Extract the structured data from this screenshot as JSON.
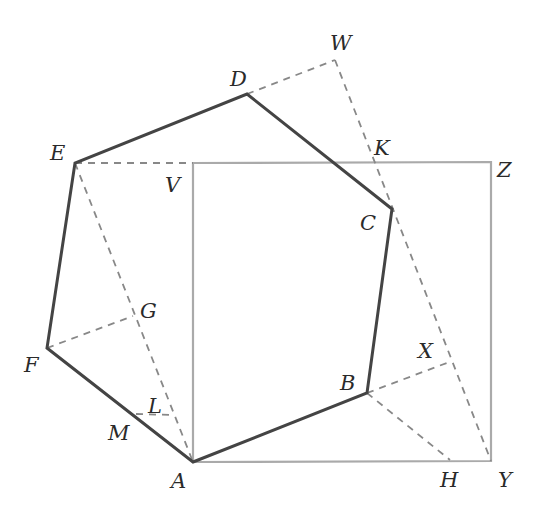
{
  "diagram": {
    "colors": {
      "hexagon": "#444444",
      "square": "#aaaaaa",
      "dashed": "#888888",
      "label": "#2a2a2a"
    },
    "points": {
      "A": {
        "x": 193,
        "y": 462,
        "label": "A",
        "lx": 171,
        "ly": 488
      },
      "B": {
        "x": 367,
        "y": 393,
        "label": "B",
        "lx": 340,
        "ly": 390
      },
      "C": {
        "x": 392,
        "y": 209,
        "label": "C",
        "lx": 360,
        "ly": 230
      },
      "D": {
        "x": 247,
        "y": 94,
        "label": "D",
        "lx": 230,
        "ly": 86
      },
      "E": {
        "x": 75,
        "y": 163,
        "label": "E",
        "lx": 50,
        "ly": 160
      },
      "F": {
        "x": 47,
        "y": 348,
        "label": "F",
        "lx": 24,
        "ly": 372
      },
      "G": {
        "x": 133,
        "y": 316,
        "label": "G",
        "lx": 140,
        "ly": 318
      },
      "H": {
        "x": 450,
        "y": 460,
        "label": "H",
        "lx": 440,
        "ly": 487
      },
      "K": {
        "x": 373,
        "y": 162,
        "label": "K",
        "lx": 374,
        "ly": 155
      },
      "L": {
        "x": 172,
        "y": 415,
        "label": "L",
        "lx": 148,
        "ly": 413
      },
      "M": {
        "x": 136,
        "y": 414,
        "label": "M",
        "lx": 108,
        "ly": 440
      },
      "V": {
        "x": 193,
        "y": 163,
        "label": "V",
        "lx": 165,
        "ly": 192
      },
      "W": {
        "x": 335,
        "y": 60,
        "label": "W",
        "lx": 330,
        "ly": 50
      },
      "X": {
        "x": 452,
        "y": 361,
        "label": "X",
        "lx": 418,
        "ly": 358
      },
      "Y": {
        "x": 491,
        "y": 461,
        "label": "Y",
        "lx": 498,
        "ly": 487
      },
      "Z": {
        "x": 491,
        "y": 162,
        "label": "Z",
        "lx": 497,
        "ly": 177
      }
    },
    "hexagon": [
      "A",
      "B",
      "C",
      "D",
      "E",
      "F"
    ],
    "square": [
      "A",
      "Y",
      "Z",
      "V"
    ],
    "dashed_segments": [
      [
        "E",
        "V"
      ],
      [
        "E",
        "A"
      ],
      [
        "F",
        "G"
      ],
      [
        "D",
        "W"
      ],
      [
        "W",
        "Y"
      ],
      [
        "B",
        "X"
      ],
      [
        "B",
        "H"
      ],
      [
        "M",
        "L"
      ]
    ]
  }
}
